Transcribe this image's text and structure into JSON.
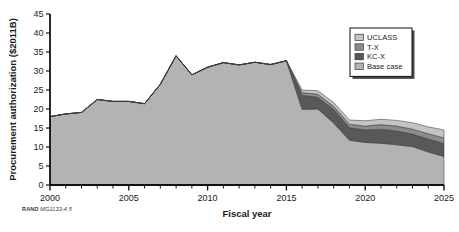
{
  "figure": {
    "credit_brand": "RAND",
    "credit_ref": "MG1133-4.5"
  },
  "chart_data": {
    "type": "area",
    "title": "",
    "xlabel": "Fiscal year",
    "ylabel": "Procurement authorization ($2011B)",
    "xlim": [
      2000,
      2025
    ],
    "ylim": [
      0,
      45
    ],
    "ytick_step": 5,
    "xtick_step": 5,
    "xticks": [
      2000,
      2005,
      2010,
      2015,
      2020,
      2025
    ],
    "xtick_labels": [
      "2000",
      "2005",
      "2010",
      "2015",
      "2020",
      "2025"
    ],
    "yticks": [
      0,
      5,
      10,
      15,
      20,
      25,
      30,
      35,
      40,
      45
    ],
    "ytick_labels": [
      "0",
      "5",
      "10",
      "15",
      "20",
      "25",
      "30",
      "35",
      "40",
      "45"
    ],
    "minor_xticks": true,
    "grid": false,
    "stacked": true,
    "legend_position": "top-right",
    "x": [
      2000,
      2001,
      2002,
      2003,
      2004,
      2005,
      2006,
      2007,
      2008,
      2009,
      2010,
      2011,
      2012,
      2013,
      2014,
      2015,
      2016,
      2017,
      2018,
      2019,
      2020,
      2021,
      2022,
      2023,
      2024,
      2025
    ],
    "series": [
      {
        "name": "Base case",
        "color": "#b3b3b3",
        "values": [
          18.0,
          18.7,
          19.1,
          22.5,
          22.0,
          22.0,
          21.4,
          26.5,
          34.0,
          29.0,
          31.0,
          32.2,
          31.6,
          32.3,
          31.7,
          32.7,
          19.9,
          20.0,
          16.3,
          11.8,
          11.2,
          11.0,
          10.6,
          10.1,
          8.7,
          7.5
        ]
      },
      {
        "name": "KC-X",
        "color": "#595959",
        "values": [
          0,
          0,
          0,
          0,
          0,
          0,
          0,
          0,
          0,
          0,
          0,
          0,
          0,
          0,
          0,
          0,
          3.7,
          3.1,
          3.6,
          3.3,
          3.3,
          3.7,
          3.6,
          3.3,
          3.4,
          3.4
        ]
      },
      {
        "name": "T-X",
        "color": "#8c8c8c",
        "values": [
          0,
          0,
          0,
          0,
          0,
          0,
          0,
          0,
          0,
          0,
          0,
          0,
          0,
          0,
          0,
          0,
          0.7,
          0.8,
          0.8,
          0.9,
          1.0,
          1.2,
          1.3,
          1.3,
          1.4,
          1.5
        ]
      },
      {
        "name": "UCLASS",
        "color": "#c4c4c4",
        "values": [
          0,
          0,
          0,
          0,
          0,
          0,
          0,
          0,
          0,
          0,
          0,
          0,
          0,
          0,
          0,
          0,
          0.7,
          0.9,
          1.0,
          1.1,
          1.4,
          1.4,
          1.5,
          1.7,
          1.8,
          2.1
        ]
      }
    ],
    "legend_entries": [
      {
        "label": "UCLASS",
        "color": "#c4c4c4"
      },
      {
        "label": "T-X",
        "color": "#8c8c8c"
      },
      {
        "label": "KC-X",
        "color": "#595959"
      },
      {
        "label": "Base case",
        "color": "#b3b3b3"
      }
    ]
  }
}
